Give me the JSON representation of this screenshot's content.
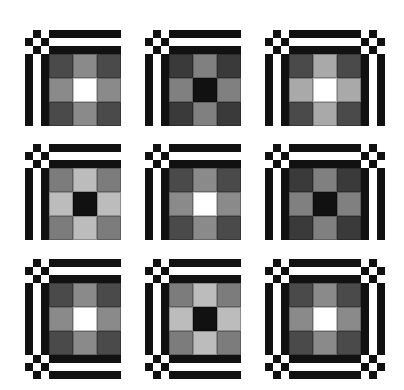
{
  "figure": {
    "colors": {
      "black": "#111111",
      "white": "#ffffff",
      "dark_gray": "#4a4a4a",
      "darker_gray": "#3a3a3a",
      "mid_gray": "#8a8a8a",
      "mid_gray_b": "#7c7c7c",
      "light_gray": "#a9a9a9",
      "lighter_gray": "#bcbcbc"
    },
    "panels": [
      {
        "id": 1,
        "x": 25,
        "y": 30,
        "borders": [
          "top",
          "left"
        ],
        "corners": [
          "top-left"
        ],
        "center": [
          "#4a4a4a",
          "#8a8a8a",
          "#4a4a4a",
          "#8a8a8a",
          "#ffffff",
          "#8a8a8a",
          "#4a4a4a",
          "#8a8a8a",
          "#4a4a4a"
        ]
      },
      {
        "id": 2,
        "x": 145,
        "y": 30,
        "borders": [
          "top",
          "left"
        ],
        "corners": [
          "top-left"
        ],
        "center": [
          "#3a3a3a",
          "#808080",
          "#3a3a3a",
          "#808080",
          "#111111",
          "#808080",
          "#3a3a3a",
          "#808080",
          "#3a3a3a"
        ]
      },
      {
        "id": 3,
        "x": 265,
        "y": 30,
        "borders": [
          "top",
          "left",
          "right"
        ],
        "corners": [
          "top-left",
          "top-right"
        ],
        "center": [
          "#4a4a4a",
          "#a9a9a9",
          "#4a4a4a",
          "#a9a9a9",
          "#ffffff",
          "#a9a9a9",
          "#4a4a4a",
          "#a9a9a9",
          "#4a4a4a"
        ]
      },
      {
        "id": 4,
        "x": 25,
        "y": 144,
        "borders": [
          "top",
          "left"
        ],
        "corners": [
          "top-left"
        ],
        "center": [
          "#7c7c7c",
          "#bcbcbc",
          "#7c7c7c",
          "#bcbcbc",
          "#111111",
          "#bcbcbc",
          "#7c7c7c",
          "#bcbcbc",
          "#7c7c7c"
        ]
      },
      {
        "id": 5,
        "x": 145,
        "y": 144,
        "borders": [
          "top",
          "left"
        ],
        "corners": [
          "top-left"
        ],
        "center": [
          "#4a4a4a",
          "#8a8a8a",
          "#4a4a4a",
          "#8a8a8a",
          "#ffffff",
          "#8a8a8a",
          "#4a4a4a",
          "#8a8a8a",
          "#4a4a4a"
        ]
      },
      {
        "id": 6,
        "x": 265,
        "y": 144,
        "borders": [
          "top",
          "left",
          "right"
        ],
        "corners": [
          "top-left",
          "top-right"
        ],
        "center": [
          "#3a3a3a",
          "#808080",
          "#3a3a3a",
          "#808080",
          "#111111",
          "#808080",
          "#3a3a3a",
          "#808080",
          "#3a3a3a"
        ]
      },
      {
        "id": 7,
        "x": 25,
        "y": 259,
        "borders": [
          "top",
          "left",
          "bottom"
        ],
        "corners": [
          "top-left",
          "bottom-left"
        ],
        "center": [
          "#4a4a4a",
          "#8a8a8a",
          "#4a4a4a",
          "#8a8a8a",
          "#ffffff",
          "#8a8a8a",
          "#4a4a4a",
          "#8a8a8a",
          "#4a4a4a"
        ]
      },
      {
        "id": 8,
        "x": 145,
        "y": 259,
        "borders": [
          "top",
          "left",
          "bottom"
        ],
        "corners": [
          "top-left",
          "bottom-left"
        ],
        "center": [
          "#7c7c7c",
          "#bcbcbc",
          "#7c7c7c",
          "#bcbcbc",
          "#111111",
          "#bcbcbc",
          "#7c7c7c",
          "#bcbcbc",
          "#7c7c7c"
        ]
      },
      {
        "id": 9,
        "x": 265,
        "y": 259,
        "borders": [
          "top",
          "left",
          "right",
          "bottom"
        ],
        "corners": [
          "top-left",
          "top-right",
          "bottom-left",
          "bottom-right"
        ],
        "center": [
          "#4a4a4a",
          "#8a8a8a",
          "#4a4a4a",
          "#8a8a8a",
          "#ffffff",
          "#8a8a8a",
          "#4a4a4a",
          "#8a8a8a",
          "#4a4a4a"
        ]
      }
    ]
  }
}
